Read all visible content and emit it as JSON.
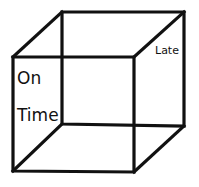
{
  "diagram": {
    "type": "necker-cube",
    "labels": {
      "on": "On",
      "time": "Time",
      "late": "Late"
    },
    "colors": {
      "stroke": "#111111",
      "background": "#ffffff"
    },
    "vertices": {
      "front_top_left": [
        13,
        57
      ],
      "front_top_right": [
        134,
        57
      ],
      "front_bottom_left": [
        13,
        171
      ],
      "front_bottom_right": [
        134,
        172
      ],
      "back_top_left": [
        62,
        12
      ],
      "back_top_right": [
        184,
        12
      ],
      "back_bottom_left": [
        62,
        124
      ],
      "back_bottom_right": [
        184,
        126
      ]
    }
  }
}
